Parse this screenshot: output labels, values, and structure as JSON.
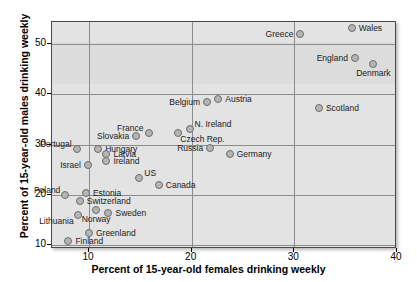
{
  "chart_data": {
    "type": "scatter",
    "title": "",
    "xlabel": "Percent of 15-year-old females drinking weekly",
    "ylabel": "Percent of 15-year-old males drinking weekly",
    "xlim": [
      6.4,
      40
    ],
    "ylim": [
      9.3,
      54.3
    ],
    "xticks": [
      10,
      20,
      30,
      40
    ],
    "yticks": [
      10,
      20,
      30,
      40,
      50
    ],
    "grid": true,
    "legend": "none",
    "points": [
      {
        "label": "Wales",
        "x": 35.6,
        "y": 53.2,
        "label_pos": "right"
      },
      {
        "label": "Greece",
        "x": 30.6,
        "y": 52.0,
        "label_pos": "left"
      },
      {
        "label": "England",
        "x": 35.9,
        "y": 47.1,
        "label_pos": "left"
      },
      {
        "label": "Denmark",
        "x": 37.7,
        "y": 45.9,
        "label_pos": "below"
      },
      {
        "label": "Scotland",
        "x": 32.4,
        "y": 37.3,
        "label_pos": "right"
      },
      {
        "label": "Austria",
        "x": 22.6,
        "y": 39.1,
        "label_pos": "right"
      },
      {
        "label": "Belgium",
        "x": 21.5,
        "y": 38.5,
        "label_pos": "left"
      },
      {
        "label": "N. Ireland",
        "x": 19.8,
        "y": 33.0,
        "label_pos": "above-right"
      },
      {
        "label": "Czech Rep.",
        "x": 18.7,
        "y": 32.2,
        "label_pos": "below-right"
      },
      {
        "label": "France",
        "x": 15.8,
        "y": 32.3,
        "label_pos": "above-left"
      },
      {
        "label": "Slovakia",
        "x": 14.6,
        "y": 31.7,
        "label_pos": "left"
      },
      {
        "label": "Hungary",
        "x": 10.9,
        "y": 29.2,
        "label_pos": "right"
      },
      {
        "label": "Latvia",
        "x": 11.7,
        "y": 28.2,
        "label_pos": "right"
      },
      {
        "label": "Ireland",
        "x": 11.7,
        "y": 26.8,
        "label_pos": "right"
      },
      {
        "label": "Portugal",
        "x": 8.8,
        "y": 29.2,
        "label_pos": "above-left"
      },
      {
        "label": "Israel",
        "x": 9.9,
        "y": 26.0,
        "label_pos": "left"
      },
      {
        "label": "Russia",
        "x": 21.8,
        "y": 29.3,
        "label_pos": "left"
      },
      {
        "label": "Germany",
        "x": 23.7,
        "y": 28.1,
        "label_pos": "right"
      },
      {
        "label": "US",
        "x": 14.9,
        "y": 23.3,
        "label_pos": "above-right"
      },
      {
        "label": "Canada",
        "x": 16.8,
        "y": 21.9,
        "label_pos": "right"
      },
      {
        "label": "Poland",
        "x": 7.7,
        "y": 20.0,
        "label_pos": "above-left"
      },
      {
        "label": "Estonia",
        "x": 9.7,
        "y": 20.4,
        "label_pos": "right"
      },
      {
        "label": "Switzerland",
        "x": 9.1,
        "y": 18.8,
        "label_pos": "right"
      },
      {
        "label": "Norway",
        "x": 10.7,
        "y": 17.0,
        "label_pos": "below"
      },
      {
        "label": "Sweden",
        "x": 11.9,
        "y": 16.4,
        "label_pos": "right"
      },
      {
        "label": "Lithuania",
        "x": 8.9,
        "y": 16.0,
        "label_pos": "below-left"
      },
      {
        "label": "Greenland",
        "x": 10.0,
        "y": 12.5,
        "label_pos": "right"
      },
      {
        "label": "Finland",
        "x": 8.0,
        "y": 10.8,
        "label_pos": "right"
      }
    ]
  }
}
